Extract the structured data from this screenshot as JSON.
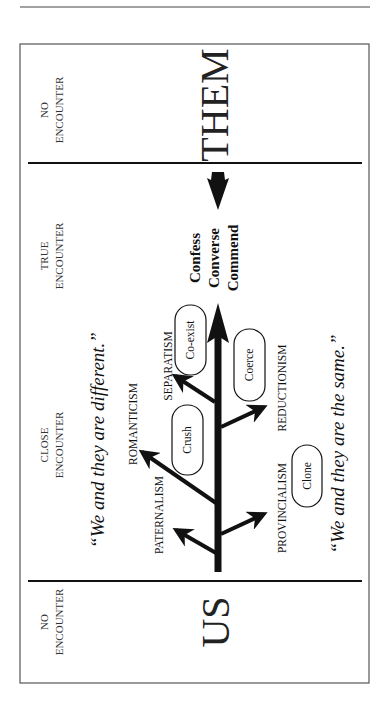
{
  "zones": {
    "them_zone": {
      "label_line1": "NO",
      "label_line2": "ENCOUNTER",
      "big_word": "THEM"
    },
    "true_zone": {
      "label_line1": "TRUE",
      "label_line2": "ENCOUNTER"
    },
    "close_zone": {
      "label_line1": "CLOSE",
      "label_line2": "ENCOUNTER"
    },
    "us_zone": {
      "label_line1": "NO",
      "label_line2": "ENCOUNTER",
      "big_word": "US"
    }
  },
  "verbs": [
    "Confess",
    "Converse",
    "Commend"
  ],
  "quotes": {
    "different": "“We and they are different.”",
    "same": "“We and they are the same.”"
  },
  "branches": {
    "left": [
      "PATERNALISM",
      "ROMANTICISM",
      "SEPARATISM"
    ],
    "right": [
      "PROVINCIALISM",
      "REDUCTIONISM"
    ]
  },
  "ovals": {
    "coexist": "Co-exist",
    "crush": "Crush",
    "coerce": "Coerce",
    "clone": "Clone"
  },
  "colors": {
    "ink": "#111111",
    "border": "#555555",
    "background": "#ffffff"
  }
}
